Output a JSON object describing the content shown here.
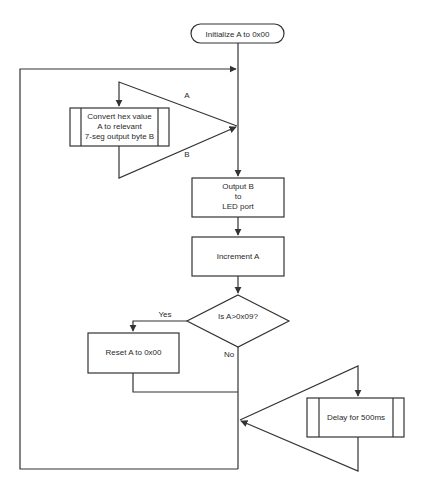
{
  "diagram": {
    "type": "flowchart",
    "colors": {
      "stroke": "#333333",
      "fill": "#ffffff",
      "text": "#2a2a2a"
    },
    "nodes": {
      "start": {
        "shape": "terminal",
        "label": "Initialize A to 0x00"
      },
      "convert": {
        "shape": "subprocess",
        "lines": [
          "Convert hex value",
          "A to relevant",
          "7-seg output byte B"
        ]
      },
      "output": {
        "shape": "process",
        "lines": [
          "Output B",
          "to",
          "LED port"
        ]
      },
      "increment": {
        "shape": "process",
        "label": "Increment A"
      },
      "decision": {
        "shape": "decision",
        "label": "Is A>0x09?"
      },
      "reset": {
        "shape": "process",
        "label": "Reset A to 0x00"
      },
      "delay": {
        "shape": "subprocess",
        "label": "Delay for 500ms"
      }
    },
    "edge_labels": {
      "param_a": "A",
      "param_b": "B",
      "yes": "Yes",
      "no": "No"
    },
    "edges": [
      {
        "from": "start",
        "to": "main-line"
      },
      {
        "from": "loop-back",
        "to": "main-line"
      },
      {
        "from": "main-line",
        "to": "convert",
        "label": "A"
      },
      {
        "from": "convert",
        "to": "main-line",
        "label": "B"
      },
      {
        "from": "main-line",
        "to": "output"
      },
      {
        "from": "output",
        "to": "increment"
      },
      {
        "from": "increment",
        "to": "decision"
      },
      {
        "from": "decision",
        "to": "reset",
        "label": "Yes"
      },
      {
        "from": "decision",
        "to": "merge",
        "label": "No"
      },
      {
        "from": "reset",
        "to": "merge"
      },
      {
        "from": "merge",
        "to": "delay"
      },
      {
        "from": "delay",
        "to": "merge"
      },
      {
        "from": "merge",
        "to": "loop-back"
      }
    ]
  }
}
